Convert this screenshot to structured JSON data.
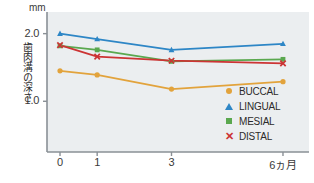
{
  "chart_data": {
    "type": "line",
    "title": "",
    "xlabel": "",
    "ylabel": "歯肉溝の深さ",
    "unit": "mm",
    "x": [
      0,
      1,
      3,
      6
    ],
    "categories": [
      "0",
      "1",
      "3",
      "6ヵ月"
    ],
    "xtick_labels": [
      "0",
      "1",
      "3",
      "6ヵ月"
    ],
    "ytick_labels": [
      "2.0",
      "1.0"
    ],
    "ytick_values": [
      2.0,
      1.0
    ],
    "ylim": [
      0.25,
      2.32
    ],
    "xlim": [
      -0.35,
      6.7
    ],
    "grid": false,
    "legend_position": "inside-right",
    "series": [
      {
        "name": "BUCCAL",
        "color": "#e2a33c",
        "marker": "circle",
        "values": [
          1.45,
          1.39,
          1.18,
          1.29
        ]
      },
      {
        "name": "LINGUAL",
        "color": "#2d86c6",
        "marker": "triangle",
        "values": [
          2.0,
          1.92,
          1.76,
          1.85
        ]
      },
      {
        "name": "MESIAL",
        "color": "#5aa84f",
        "marker": "square",
        "values": [
          1.82,
          1.76,
          1.59,
          1.62
        ]
      },
      {
        "name": "DISTAL",
        "color": "#cc3434",
        "marker": "x",
        "values": [
          1.83,
          1.66,
          1.6,
          1.56
        ]
      }
    ]
  },
  "legend": {
    "items": [
      {
        "label": "BUCCAL",
        "color": "#e2a33c",
        "marker": "circle"
      },
      {
        "label": "LINGUAL",
        "color": "#2d86c6",
        "marker": "triangle"
      },
      {
        "label": "MESIAL",
        "color": "#5aa84f",
        "marker": "square"
      },
      {
        "label": "DISTAL",
        "color": "#cc3434",
        "marker": "x"
      }
    ]
  },
  "style": {
    "plot_background": "#ebeef0",
    "axis_color": "#8a9096",
    "text_color": "#2b2b2b"
  }
}
